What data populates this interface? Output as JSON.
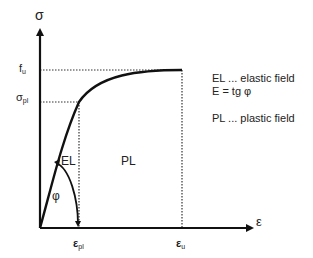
{
  "diagram": {
    "axes": {
      "y_label": "σ",
      "x_label": "ε",
      "y_ticks": [
        {
          "main": "f",
          "sub": "u"
        },
        {
          "main": "σ",
          "sub": "pl"
        }
      ],
      "x_ticks": [
        {
          "main": "ε",
          "sub": "pl"
        },
        {
          "main": "ε",
          "sub": "u"
        }
      ]
    },
    "regions": {
      "elastic": "EL",
      "plastic": "PL"
    },
    "angle_label": "φ",
    "legend": [
      "EL  ... elastic field",
      "E = tg φ",
      "PL  ... plastic field"
    ],
    "colors": {
      "line": "#111111",
      "dotted": "#333333",
      "text": "#222222"
    }
  }
}
